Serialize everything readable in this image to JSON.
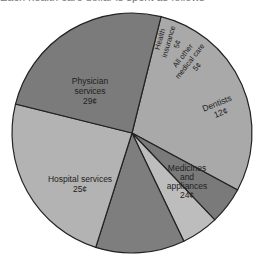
{
  "top_caption": "Each health care dollar is spent as follows",
  "chart_data": {
    "type": "pie",
    "title": "",
    "unit": "cents per health care dollar",
    "slices": [
      {
        "label": "Physician services",
        "value": 29,
        "display": "29¢",
        "color": "#a9a9a9"
      },
      {
        "label": "Health insurance",
        "value": 5,
        "display": "5¢",
        "color": "#7a7a7a"
      },
      {
        "label": "All other medical care",
        "value": 5,
        "display": "5¢",
        "color": "#bdbdbd"
      },
      {
        "label": "Dentists",
        "value": 12,
        "display": "12¢",
        "color": "#7e7e7e"
      },
      {
        "label": "Medicines and appliances",
        "value": 24,
        "display": "24¢",
        "color": "#b3b3b3"
      },
      {
        "label": "Hospital services",
        "value": 25,
        "display": "25¢",
        "color": "#7b7b7b"
      }
    ],
    "start_angle_deg": 76,
    "direction": "clockwise",
    "legend": "none (labels inside slices)"
  },
  "labels": {
    "physician": [
      "Physician",
      "services",
      "29¢"
    ],
    "health": [
      "Health",
      "insurance",
      "5¢"
    ],
    "other": [
      "All other",
      "medical care",
      "5¢"
    ],
    "dentists": [
      "Dentists",
      "12¢"
    ],
    "medicines": [
      "Medicines",
      "and",
      "appliances",
      "24¢"
    ],
    "hospital": [
      "Hospital services",
      "25¢"
    ]
  }
}
